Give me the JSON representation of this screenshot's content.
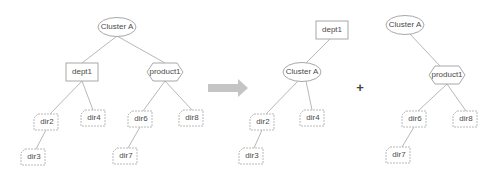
{
  "diagram": {
    "type": "tree-transformation",
    "operator": "+",
    "transition": "arrow-right",
    "before": {
      "nodes": [
        {
          "id": "clusterA",
          "label": "Cluster A",
          "shape": "ellipse"
        },
        {
          "id": "dept1",
          "label": "dept1",
          "shape": "rectangle"
        },
        {
          "id": "product1",
          "label": "product1",
          "shape": "hexagon"
        },
        {
          "id": "dir2",
          "label": "dir2",
          "shape": "folder"
        },
        {
          "id": "dir3",
          "label": "dir3",
          "shape": "folder"
        },
        {
          "id": "dir4",
          "label": "dir4",
          "shape": "folder"
        },
        {
          "id": "dir6",
          "label": "dir6",
          "shape": "folder"
        },
        {
          "id": "dir7",
          "label": "dir7",
          "shape": "folder"
        },
        {
          "id": "dir8",
          "label": "dir8",
          "shape": "folder"
        }
      ],
      "edges": [
        [
          "clusterA",
          "dept1"
        ],
        [
          "clusterA",
          "product1"
        ],
        [
          "dept1",
          "dir2"
        ],
        [
          "dept1",
          "dir4"
        ],
        [
          "dir2",
          "dir3"
        ],
        [
          "product1",
          "dir6"
        ],
        [
          "product1",
          "dir8"
        ],
        [
          "dir6",
          "dir7"
        ]
      ]
    },
    "after_tree1": {
      "nodes": [
        {
          "id": "dept1",
          "label": "dept1",
          "shape": "rectangle"
        },
        {
          "id": "clusterA",
          "label": "Cluster A",
          "shape": "ellipse"
        },
        {
          "id": "dir2",
          "label": "dir2",
          "shape": "folder"
        },
        {
          "id": "dir3",
          "label": "dir3",
          "shape": "folder"
        },
        {
          "id": "dir4",
          "label": "dir4",
          "shape": "folder"
        }
      ],
      "edges": [
        [
          "dept1",
          "clusterA"
        ],
        [
          "clusterA",
          "dir2"
        ],
        [
          "clusterA",
          "dir4"
        ],
        [
          "dir2",
          "dir3"
        ]
      ]
    },
    "after_tree2": {
      "nodes": [
        {
          "id": "clusterA",
          "label": "Cluster A",
          "shape": "ellipse"
        },
        {
          "id": "product1",
          "label": "product1",
          "shape": "hexagon"
        },
        {
          "id": "dir6",
          "label": "dir6",
          "shape": "folder"
        },
        {
          "id": "dir7",
          "label": "dir7",
          "shape": "folder"
        },
        {
          "id": "dir8",
          "label": "dir8",
          "shape": "folder"
        }
      ],
      "edges": [
        [
          "clusterA",
          "product1"
        ],
        [
          "product1",
          "dir6"
        ],
        [
          "product1",
          "dir8"
        ],
        [
          "dir6",
          "dir7"
        ]
      ]
    }
  },
  "labels": {
    "left": {
      "clusterA": "Cluster A",
      "dept1": "dept1",
      "product1": "product1",
      "dir2": "dir2",
      "dir3": "dir3",
      "dir4": "dir4",
      "dir6": "dir6",
      "dir7": "dir7",
      "dir8": "dir8"
    },
    "right1": {
      "dept1": "dept1",
      "clusterA": "Cluster A",
      "dir2": "dir2",
      "dir3": "dir3",
      "dir4": "dir4"
    },
    "right2": {
      "clusterA": "Cluster A",
      "product1": "product1",
      "dir6": "dir6",
      "dir7": "dir7",
      "dir8": "dir8"
    },
    "plus": "+"
  },
  "colors": {
    "node_stroke": "#a8a8a8",
    "edge": "#b8b8b8",
    "arrow": "#c4c4c4",
    "text": "#4a4a4a"
  }
}
